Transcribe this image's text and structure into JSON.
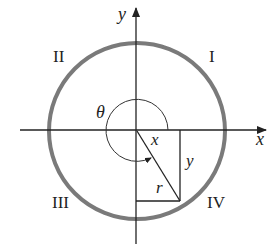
{
  "diagram": {
    "axes": {
      "x_label": "x",
      "y_label": "y"
    },
    "quadrants": {
      "I": "I",
      "II": "II",
      "III": "III",
      "IV": "IV"
    },
    "angle_label": "θ",
    "triangle": {
      "horizontal_label": "x",
      "vertical_label": "y",
      "hypotenuse_label": "r"
    },
    "colors": {
      "circle": "#7a7a7a",
      "lines": "#222222",
      "background": "#ffffff"
    }
  }
}
